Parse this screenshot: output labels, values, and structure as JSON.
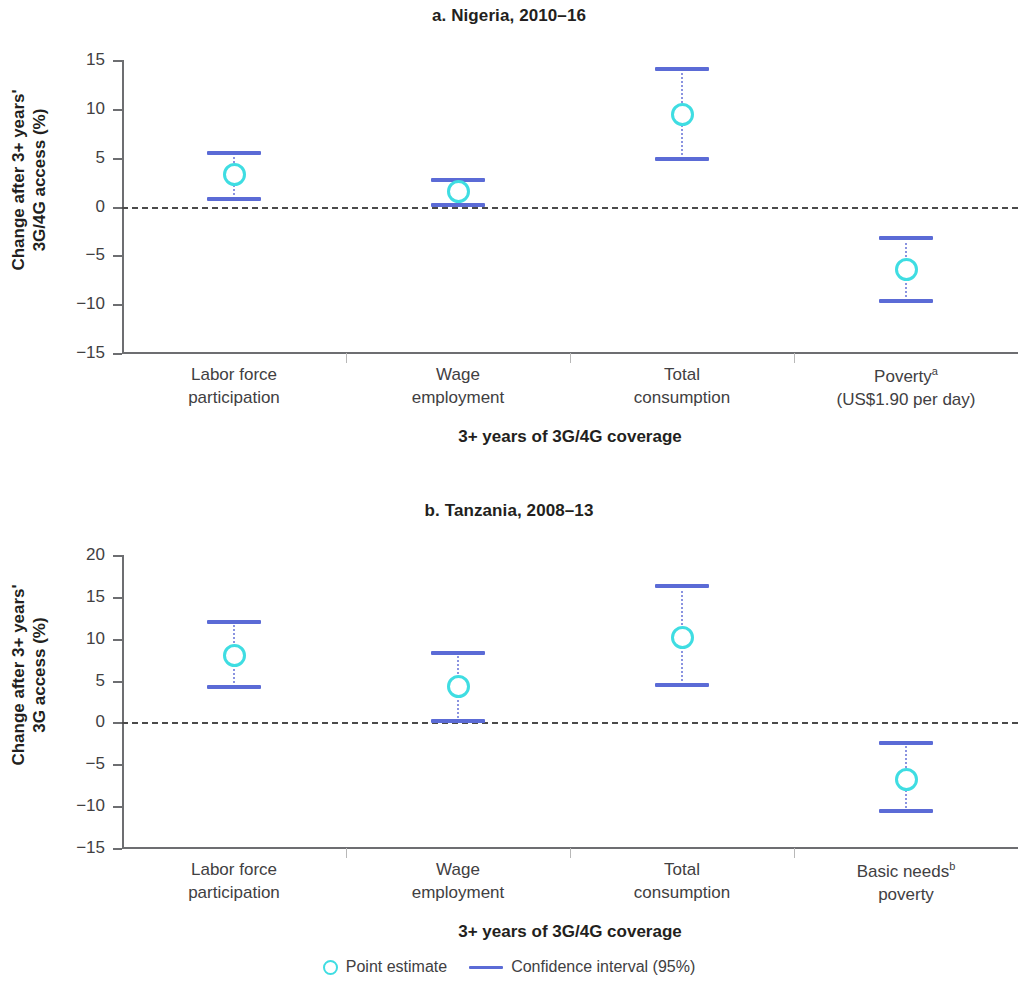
{
  "figure": {
    "legend": {
      "point_estimate_label": "Point estimate",
      "confidence_interval_label": "Confidence interval (95%)",
      "point_color": "#3fdde2",
      "interval_color": "#5b6bd6"
    }
  },
  "chart_data": [
    {
      "type": "scatter",
      "id": "panel-a",
      "title": "a. Nigeria, 2010–16",
      "ylabel": "Change after 3+ years'\n3G/4G access (%)",
      "ylabel_line1": "Change after 3+ years'",
      "ylabel_line2": "3G/4G access (%)",
      "xlabel": "3+ years of 3G/4G coverage",
      "ylim": [
        -15,
        15
      ],
      "yticks": [
        15,
        10,
        5,
        0,
        -5,
        -10,
        -15
      ],
      "ytick_labels": [
        "15",
        "10",
        "5",
        "0",
        "−5",
        "−10",
        "−15"
      ],
      "zero_reference_line": true,
      "grid": false,
      "categories": [
        {
          "label_line1": "Labor force",
          "label_line2": "participation",
          "footnote": ""
        },
        {
          "label_line1": "Wage",
          "label_line2": "employment",
          "footnote": ""
        },
        {
          "label_line1": "Total",
          "label_line2": "consumption",
          "footnote": ""
        },
        {
          "label_line1": "Poverty",
          "label_line2": "(US$1.90 per day)",
          "footnote": "a"
        }
      ],
      "point_estimates": [
        3.3,
        1.5,
        9.4,
        -6.5
      ],
      "ci_low": [
        0.8,
        0.2,
        4.9,
        -9.7
      ],
      "ci_high": [
        5.5,
        2.7,
        14.1,
        -3.2
      ]
    },
    {
      "type": "scatter",
      "id": "panel-b",
      "title": "b. Tanzania, 2008–13",
      "ylabel": "Change after 3+ years'\n3G access (%)",
      "ylabel_line1": "Change after 3+ years'",
      "ylabel_line2": "3G access (%)",
      "xlabel": "3+ years of 3G/4G coverage",
      "ylim": [
        -15,
        20
      ],
      "yticks": [
        20,
        15,
        10,
        5,
        0,
        -5,
        -10,
        -15
      ],
      "ytick_labels": [
        "20",
        "15",
        "10",
        "5",
        "0",
        "−5",
        "−10",
        "−15"
      ],
      "zero_reference_line": true,
      "grid": false,
      "categories": [
        {
          "label_line1": "Labor force",
          "label_line2": "participation",
          "footnote": ""
        },
        {
          "label_line1": "Wage",
          "label_line2": "employment",
          "footnote": ""
        },
        {
          "label_line1": "Total",
          "label_line2": "consumption",
          "footnote": ""
        },
        {
          "label_line1": "Basic needs",
          "label_line2": "poverty",
          "footnote": "b"
        }
      ],
      "point_estimates": [
        8.0,
        4.3,
        10.2,
        -6.8
      ],
      "ci_low": [
        4.2,
        0.2,
        4.5,
        -10.6
      ],
      "ci_high": [
        12.0,
        8.3,
        16.3,
        -2.5
      ]
    }
  ]
}
